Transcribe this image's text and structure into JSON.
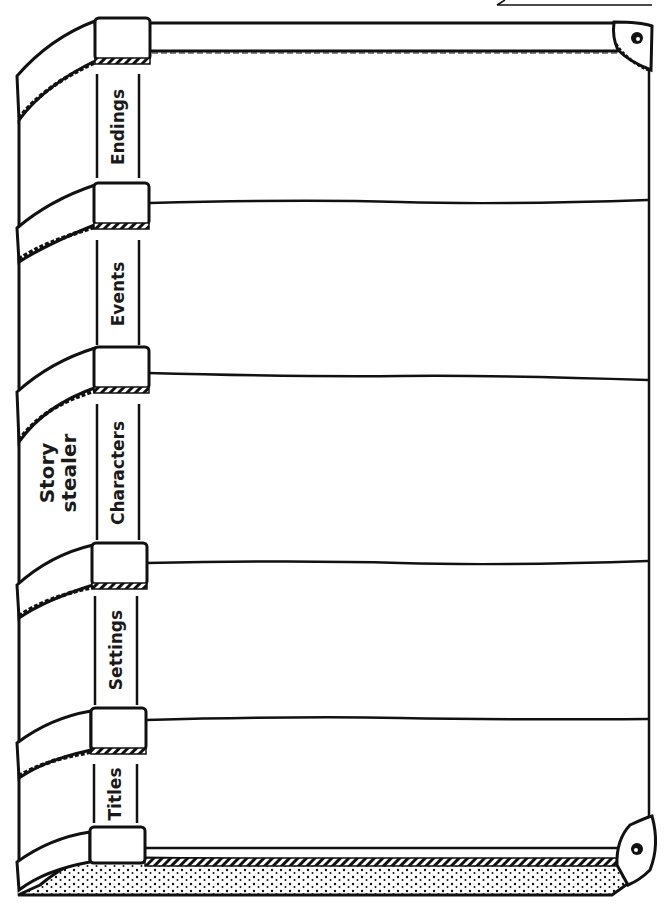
{
  "worksheet": {
    "title_line1": "Story",
    "title_line2": "stealer",
    "sections": [
      {
        "label": "Endings"
      },
      {
        "label": "Events"
      },
      {
        "label": "Characters"
      },
      {
        "label": "Settings"
      },
      {
        "label": "Titles"
      }
    ]
  },
  "colors": {
    "ink": "#111111",
    "paper": "#ffffff"
  }
}
